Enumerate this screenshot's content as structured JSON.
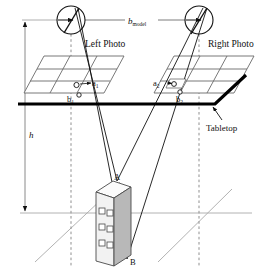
{
  "figure": {
    "type": "technical-diagram",
    "width": 269,
    "height": 270,
    "background_color": "#ffffff",
    "line_color": "#111111",
    "faint_line_color": "#9a9a9a",
    "building_face_color": "#f2f2f2",
    "building_side_color": "#b8b8b8",
    "building_top_color": "#fbfbfb"
  },
  "labels": {
    "baseline": "b",
    "baseline_subscript": "model",
    "left_photo": "Left Photo",
    "right_photo": "Right Photo",
    "tabletop": "Tabletop",
    "height": "h",
    "a1": "a",
    "a1_sub": "1",
    "b1": "b",
    "b1_sub": "1",
    "a2": "a",
    "a2_sub": "2",
    "b2": "b",
    "b2_sub": "2",
    "point_a": "A",
    "point_b": "B"
  },
  "elements": {
    "left_camera": "left-camera-lens",
    "right_camera": "right-camera-lens",
    "left_photo_plane": "left-photo-plane",
    "right_photo_plane": "right-photo-plane",
    "tabletop_line": "tabletop-surface-line",
    "building": "building-model",
    "height_dimension": "height-dimension-arrow",
    "baseline_dimension": "baseline-dimension-arrow",
    "ground_plane": "ground-plane-lines"
  },
  "geometry": {
    "left_camera_center": [
      71,
      20
    ],
    "right_camera_center": [
      199,
      20
    ],
    "camera_radius": 14,
    "tabletop_y": 104,
    "ground_line_y": 213,
    "point_a": [
      117,
      181
    ],
    "point_b": [
      127,
      259
    ],
    "baseline_y": 20,
    "height_arrow_x": 25,
    "building_windows_rows": 3,
    "building_windows_cols": 2
  }
}
